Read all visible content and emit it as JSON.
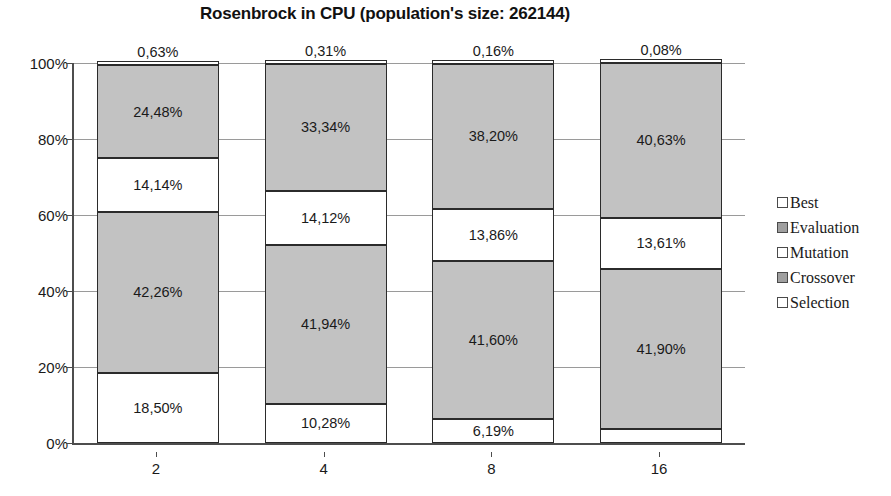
{
  "chart_data": {
    "type": "bar",
    "title": "Rosenbrock in CPU (population's size: 262144)",
    "xlabel": "",
    "ylabel": "",
    "stacked": true,
    "percent_stacked": true,
    "grid": true,
    "legend_position": "right",
    "ylim": [
      0,
      100
    ],
    "ytick_labels": [
      "0%",
      "20%",
      "40%",
      "60%",
      "80%",
      "100%"
    ],
    "ytick_values": [
      0,
      20,
      40,
      60,
      80,
      100
    ],
    "categories": [
      "2",
      "4",
      "8",
      "16"
    ],
    "series": [
      {
        "name": "Selection",
        "fill": "white",
        "values": [
          18.5,
          10.28,
          6.19,
          3.79
        ],
        "labels": [
          "18,50%",
          "10,28%",
          "6,19%",
          "3,79%"
        ]
      },
      {
        "name": "Crossover",
        "fill": "gray",
        "values": [
          42.26,
          41.94,
          41.6,
          41.9
        ],
        "labels": [
          "42,26%",
          "41,94%",
          "41,60%",
          "41,90%"
        ]
      },
      {
        "name": "Mutation",
        "fill": "white",
        "values": [
          14.14,
          14.12,
          13.86,
          13.61
        ],
        "labels": [
          "14,14%",
          "14,12%",
          "13,86%",
          "13,61%"
        ]
      },
      {
        "name": "Evaluation",
        "fill": "gray",
        "values": [
          24.48,
          33.34,
          38.2,
          40.63
        ],
        "labels": [
          "24,48%",
          "33,34%",
          "38,20%",
          "40,63%"
        ]
      },
      {
        "name": "Best",
        "fill": "white",
        "values": [
          0.63,
          0.31,
          0.16,
          0.08
        ],
        "labels": [
          "0,63%",
          "0,31%",
          "0,16%",
          "0,08%"
        ]
      }
    ],
    "legend_entries": [
      {
        "label": "Best",
        "fill": "white"
      },
      {
        "label": "Evaluation",
        "fill": "gray"
      },
      {
        "label": "Mutation",
        "fill": "white"
      },
      {
        "label": "Crossover",
        "fill": "gray"
      },
      {
        "label": "Selection",
        "fill": "white"
      }
    ],
    "colors": {
      "white_fill": "#ffffff",
      "gray_fill": "#c2c2c2",
      "segment_border": "#2b2b2b",
      "gridline": "#9a9a9a",
      "axis": "#4d4d4d",
      "text": "#1a1a1a"
    }
  }
}
